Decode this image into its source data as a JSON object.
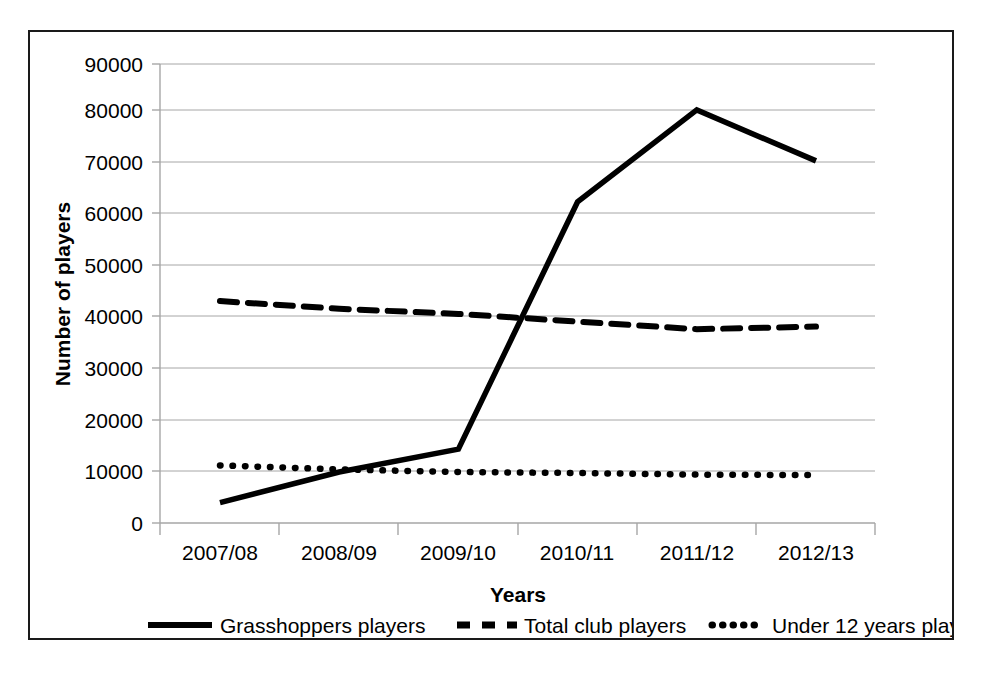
{
  "chart_data": {
    "type": "line",
    "title": "",
    "xlabel": "Years",
    "ylabel": "Number of players",
    "categories": [
      "2007/08",
      "2008/09",
      "2009/10",
      "2010/11",
      "2011/12",
      "2012/13"
    ],
    "ylim": [
      0,
      90000
    ],
    "y_ticks": [
      "0",
      "10000",
      "20000",
      "30000",
      "40000",
      "50000",
      "60000",
      "70000",
      "80000",
      "90000"
    ],
    "y_tick_values": [
      0,
      10000,
      20000,
      30000,
      40000,
      50000,
      60000,
      70000,
      80000,
      90000
    ],
    "grid": "horizontal",
    "legend_position": "bottom",
    "series": [
      {
        "name": "Grasshoppers players",
        "style": "solid",
        "values": [
          4000,
          10000,
          14500,
          63000,
          81000,
          71000
        ]
      },
      {
        "name": "Total club players",
        "style": "dashed",
        "values": [
          43500,
          42000,
          41000,
          39500,
          38000,
          38500
        ]
      },
      {
        "name": "Under 12 years players",
        "style": "dotted",
        "values": [
          11300,
          10500,
          10000,
          9800,
          9500,
          9400
        ]
      }
    ]
  },
  "legend": {
    "items": [
      {
        "label": "Grasshoppers players",
        "marker": "solid-line-marker"
      },
      {
        "label": "Total club players",
        "marker": "dashed-line-marker"
      },
      {
        "label": "Under 12 years players",
        "marker": "dotted-line-marker"
      }
    ]
  },
  "axes": {
    "y_title": "Number of players",
    "x_title": "Years"
  }
}
